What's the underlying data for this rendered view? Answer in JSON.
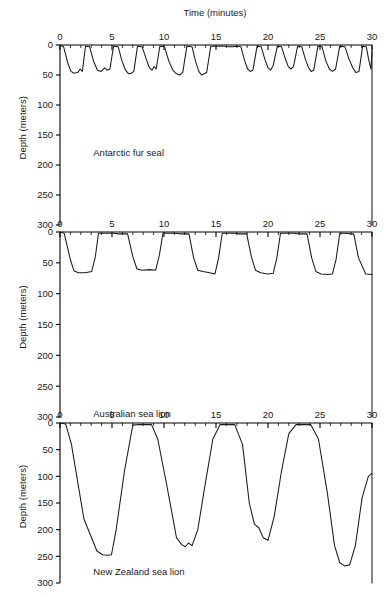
{
  "figure": {
    "xlabel": "Time (minutes)",
    "ylabel": "Depth (meters)",
    "caption": ""
  },
  "chart_data": {
    "type": "line",
    "title": "Time (minutes)",
    "xlabel": "Time (minutes)",
    "ylabel": "Depth (meters)",
    "xlim": [
      0,
      30
    ],
    "ylim": [
      0,
      300
    ],
    "y_inverted": true,
    "grid": false,
    "legend": "none",
    "xticks": [
      0,
      5,
      10,
      15,
      20,
      25,
      30
    ],
    "xtick_labels": [
      "0",
      "5",
      "10",
      "15",
      "20",
      "25",
      "30"
    ],
    "yticks": [
      0,
      50,
      100,
      150,
      200,
      250,
      300
    ],
    "ytick_labels": [
      "0",
      "50",
      "100",
      "150",
      "200",
      "250",
      "300"
    ],
    "x_minor_interval": 1,
    "panels": [
      {
        "name": "antarctic-fur-seal",
        "label": "Antarctic fur seal",
        "label_x": 3.2,
        "label_y": 185,
        "max_depth": 52,
        "dive_shape": "V-shaped",
        "dive_count": 15,
        "x": [
          0.0,
          0.35,
          0.75,
          1.05,
          1.35,
          1.7,
          1.95,
          2.15,
          2.45,
          2.85,
          3.25,
          3.6,
          3.95,
          4.3,
          4.55,
          4.8,
          5.15,
          5.6,
          5.95,
          6.3,
          6.6,
          6.85,
          7.1,
          7.45,
          7.9,
          8.3,
          8.6,
          8.85,
          9.05,
          9.25,
          9.6,
          10.05,
          10.45,
          10.85,
          11.2,
          11.5,
          11.8,
          12.2,
          12.7,
          13.05,
          13.35,
          13.6,
          13.85,
          14.1,
          14.5,
          15.0,
          15.4,
          15.8,
          16.2,
          16.6,
          17.0,
          17.4,
          17.75,
          18.05,
          18.3,
          18.55,
          18.95,
          19.35,
          19.7,
          20.0,
          20.25,
          20.5,
          20.9,
          21.3,
          21.65,
          21.95,
          22.2,
          22.45,
          22.85,
          23.25,
          23.6,
          23.9,
          24.15,
          24.4,
          24.8,
          25.2,
          25.55,
          25.9,
          26.2,
          26.5,
          26.9,
          27.4,
          27.8,
          28.15,
          28.45,
          28.75,
          29.1,
          29.45,
          29.7,
          29.9,
          30.0
        ],
        "y": [
          0,
          3,
          30,
          44,
          47,
          46,
          40,
          44,
          2,
          3,
          28,
          42,
          44,
          38,
          42,
          40,
          2,
          3,
          26,
          42,
          48,
          47,
          44,
          2,
          3,
          24,
          38,
          42,
          36,
          40,
          2,
          3,
          26,
          42,
          48,
          50,
          46,
          2,
          3,
          28,
          44,
          50,
          48,
          46,
          2,
          2,
          2,
          2,
          3,
          3,
          2,
          3,
          26,
          40,
          44,
          42,
          2,
          3,
          24,
          38,
          42,
          34,
          2,
          3,
          22,
          36,
          40,
          36,
          2,
          3,
          24,
          38,
          44,
          42,
          2,
          3,
          26,
          40,
          44,
          40,
          2,
          3,
          24,
          38,
          46,
          44,
          2,
          3,
          26,
          40,
          10
        ]
      },
      {
        "name": "australian-sea-lion",
        "label": "Australian sea lion",
        "label_x": 3.2,
        "label_y": 300,
        "max_depth": 72,
        "dive_shape": "square / flat-bottomed",
        "dive_count": 8,
        "x": [
          0.0,
          0.4,
          1.0,
          1.35,
          1.75,
          2.4,
          3.05,
          3.4,
          3.7,
          4.3,
          5.2,
          5.55,
          6.0,
          6.5,
          7.0,
          7.4,
          7.9,
          8.6,
          9.2,
          9.55,
          9.9,
          10.3,
          11.15,
          11.5,
          11.9,
          12.4,
          12.85,
          13.25,
          13.75,
          14.4,
          14.9,
          15.25,
          15.6,
          16.05,
          16.75,
          17.1,
          17.5,
          17.95,
          18.4,
          18.8,
          19.3,
          19.95,
          20.5,
          20.85,
          21.2,
          21.7,
          22.5,
          22.85,
          23.25,
          23.75,
          24.2,
          24.6,
          25.1,
          25.7,
          26.2,
          26.55,
          26.9,
          27.35,
          27.85,
          28.25,
          28.7,
          29.4,
          30.0
        ],
        "y": [
          0,
          2,
          45,
          63,
          66,
          66,
          64,
          40,
          2,
          2,
          2,
          3,
          3,
          3,
          40,
          60,
          62,
          61,
          62,
          38,
          2,
          2,
          2,
          3,
          3,
          3,
          42,
          62,
          64,
          66,
          68,
          42,
          2,
          2,
          2,
          3,
          3,
          3,
          40,
          62,
          66,
          68,
          67,
          42,
          2,
          2,
          2,
          3,
          3,
          3,
          42,
          64,
          68,
          69,
          68,
          44,
          2,
          2,
          3,
          3,
          42,
          68,
          69
        ]
      },
      {
        "name": "new-zealand-sea-lion",
        "label": "New Zealand sea lion",
        "label_x": 3.2,
        "label_y": 285,
        "max_depth": 270,
        "dive_shape": "deep V-shaped",
        "dive_count": 4,
        "x": [
          0.0,
          0.55,
          1.1,
          2.3,
          3.55,
          4.1,
          4.55,
          4.95,
          5.4,
          6.2,
          7.0,
          7.6,
          8.2,
          8.8,
          9.4,
          10.3,
          11.2,
          11.7,
          12.05,
          12.35,
          12.7,
          13.25,
          14.0,
          14.7,
          15.4,
          16.1,
          16.8,
          17.55,
          18.2,
          18.7,
          19.1,
          19.55,
          20.0,
          20.6,
          21.3,
          22.0,
          22.7,
          23.4,
          24.1,
          24.85,
          25.7,
          26.4,
          26.9,
          27.35,
          27.85,
          28.4,
          29.05,
          29.65,
          29.95,
          30.0
        ],
        "y": [
          0,
          2,
          40,
          180,
          240,
          247,
          248,
          247,
          200,
          90,
          4,
          3,
          3,
          3,
          30,
          120,
          215,
          228,
          232,
          225,
          230,
          200,
          110,
          30,
          3,
          3,
          3,
          40,
          150,
          190,
          196,
          215,
          220,
          175,
          90,
          20,
          3,
          3,
          3,
          30,
          130,
          230,
          262,
          268,
          266,
          230,
          140,
          100,
          95,
          95
        ]
      }
    ]
  }
}
